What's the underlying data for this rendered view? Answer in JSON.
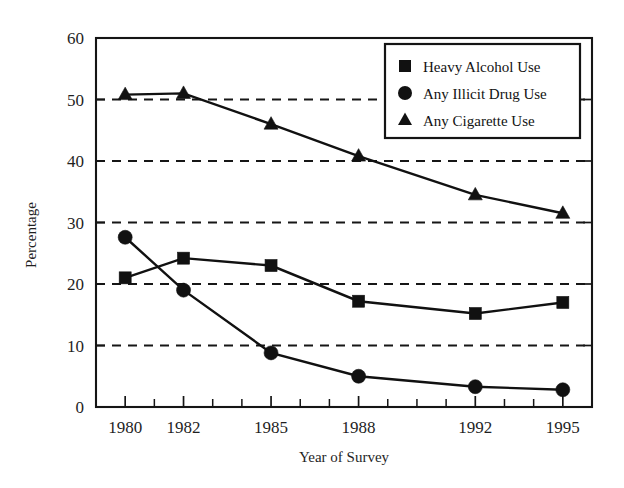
{
  "chart_data": {
    "type": "line",
    "title": "",
    "xlabel": "Year of Survey",
    "ylabel": "Percentage",
    "x": [
      1980,
      1982,
      1985,
      1988,
      1992,
      1995
    ],
    "categories": [
      "1980",
      "1982",
      "1985",
      "1988",
      "1992",
      "1995"
    ],
    "xlim": [
      1979,
      1996
    ],
    "ylim": [
      0,
      60
    ],
    "yticks": [
      0,
      10,
      20,
      30,
      40,
      50,
      60
    ],
    "ytick_labels": [
      "0",
      "10",
      "20",
      "30",
      "40",
      "50",
      "60"
    ],
    "xtick_labels": [
      "1980",
      "1982",
      "1985",
      "1988",
      "1992",
      "1995"
    ],
    "grid": "horizontal-dashed",
    "legend_position": "top-right",
    "series": [
      {
        "name": "Heavy Alcohol Use",
        "marker": "square",
        "color": "#111111",
        "values": [
          21.0,
          24.2,
          23.0,
          17.2,
          15.2,
          17.0
        ]
      },
      {
        "name": "Any Illicit Drug Use",
        "marker": "circle",
        "color": "#111111",
        "values": [
          27.6,
          19.0,
          8.8,
          5.0,
          3.3,
          2.8
        ]
      },
      {
        "name": "Any Cigarette Use",
        "marker": "triangle",
        "color": "#111111",
        "values": [
          50.8,
          51.0,
          46.0,
          40.8,
          34.5,
          31.5
        ]
      }
    ]
  },
  "axes": {
    "y_title": "Percentage",
    "x_title": "Year of Survey"
  },
  "legend": {
    "entries": [
      {
        "label": "Heavy Alcohol Use",
        "marker": "square"
      },
      {
        "label": "Any Illicit Drug Use",
        "marker": "circle"
      },
      {
        "label": "Any Cigarette Use",
        "marker": "triangle"
      }
    ]
  }
}
